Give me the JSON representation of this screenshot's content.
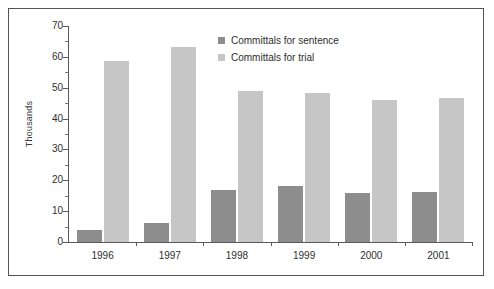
{
  "chart_data": {
    "type": "bar",
    "title": "",
    "xlabel": "",
    "ylabel": "Thousands",
    "categories": [
      "1996",
      "1997",
      "1998",
      "1999",
      "2000",
      "2001"
    ],
    "series": [
      {
        "name": "Committals for sentence",
        "color": "#8d8d8d",
        "values": [
          4.0,
          6.2,
          17.0,
          18.3,
          16.0,
          16.2
        ]
      },
      {
        "name": "Committals for trial",
        "color": "#c6c6c6",
        "values": [
          58.6,
          63.2,
          49.0,
          48.4,
          46.0,
          46.6
        ]
      }
    ],
    "ylim": [
      0,
      70
    ],
    "y_ticks": [
      0,
      10,
      20,
      30,
      40,
      50,
      60,
      70
    ],
    "y_minor_ticks": [
      5,
      15,
      25,
      35,
      45,
      55,
      65
    ],
    "grid": false,
    "legend_position": "top-center"
  },
  "legend": {
    "items": [
      {
        "label": "Committals for sentence",
        "color": "#8d8d8d"
      },
      {
        "label": "Committals for trial",
        "color": "#c6c6c6"
      }
    ]
  },
  "axis": {
    "y_title": "Thousands"
  }
}
